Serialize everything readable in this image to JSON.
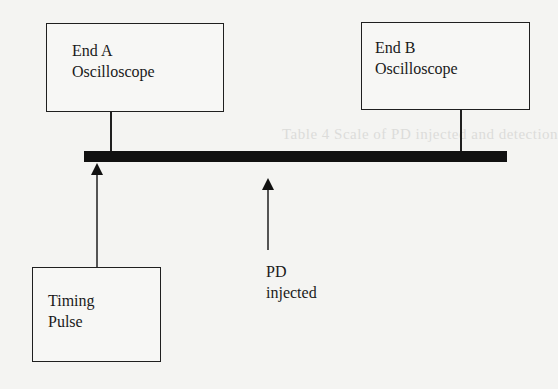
{
  "diagram": {
    "title": "",
    "nodes": [
      {
        "id": "end_a",
        "line1": "End A",
        "line2": "Oscilloscope"
      },
      {
        "id": "end_b",
        "line1": "End B",
        "line2": "Oscilloscope"
      },
      {
        "id": "timing",
        "line1": "Timing",
        "line2": "Pulse"
      }
    ],
    "pd_label": {
      "line1": "PD",
      "line2": "injected"
    },
    "cable": {
      "color": "#111111"
    },
    "background_bleed_text": "Table 4 Scale of PD injected and detection"
  }
}
